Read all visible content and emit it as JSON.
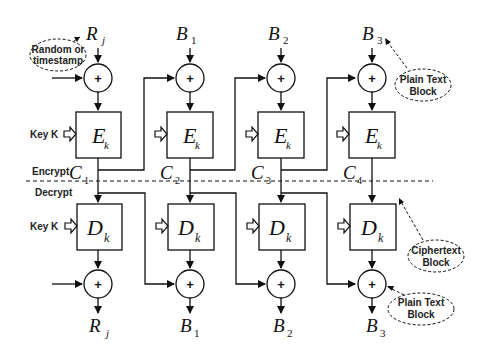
{
  "diagram": {
    "type": "block-cipher-chaining",
    "encrypt_label": "Encrypt",
    "decrypt_label": "Decrypt",
    "key_label": "Key K",
    "xor_symbol": "+",
    "columns": [
      {
        "input_main": "R",
        "input_sub": "j",
        "enc_main": "E",
        "enc_sub": "k",
        "cipher_main": "C",
        "cipher_sub": "1",
        "dec_main": "D",
        "dec_sub": "k",
        "output_main": "R",
        "output_sub": "j"
      },
      {
        "input_main": "B",
        "input_sub": "1",
        "enc_main": "E",
        "enc_sub": "k",
        "cipher_main": "C",
        "cipher_sub": "2",
        "dec_main": "D",
        "dec_sub": "k",
        "output_main": "B",
        "output_sub": "1"
      },
      {
        "input_main": "B",
        "input_sub": "2",
        "enc_main": "E",
        "enc_sub": "k",
        "cipher_main": "C",
        "cipher_sub": "3",
        "dec_main": "D",
        "dec_sub": "k",
        "output_main": "B",
        "output_sub": "2"
      },
      {
        "input_main": "B",
        "input_sub": "3",
        "enc_main": "E",
        "enc_sub": "k",
        "cipher_main": "C",
        "cipher_sub": "4",
        "dec_main": "D",
        "dec_sub": "k",
        "output_main": "B",
        "output_sub": "3"
      }
    ],
    "callouts": {
      "random": {
        "line1": "Random or",
        "line2": "timestamp"
      },
      "plain_top": {
        "line1": "Plain Text",
        "line2": "Block"
      },
      "cipher": {
        "line1": "Ciphertext",
        "line2": "Block"
      },
      "plain_bottom": {
        "line1": "Plain Text",
        "line2": "Block"
      }
    }
  }
}
